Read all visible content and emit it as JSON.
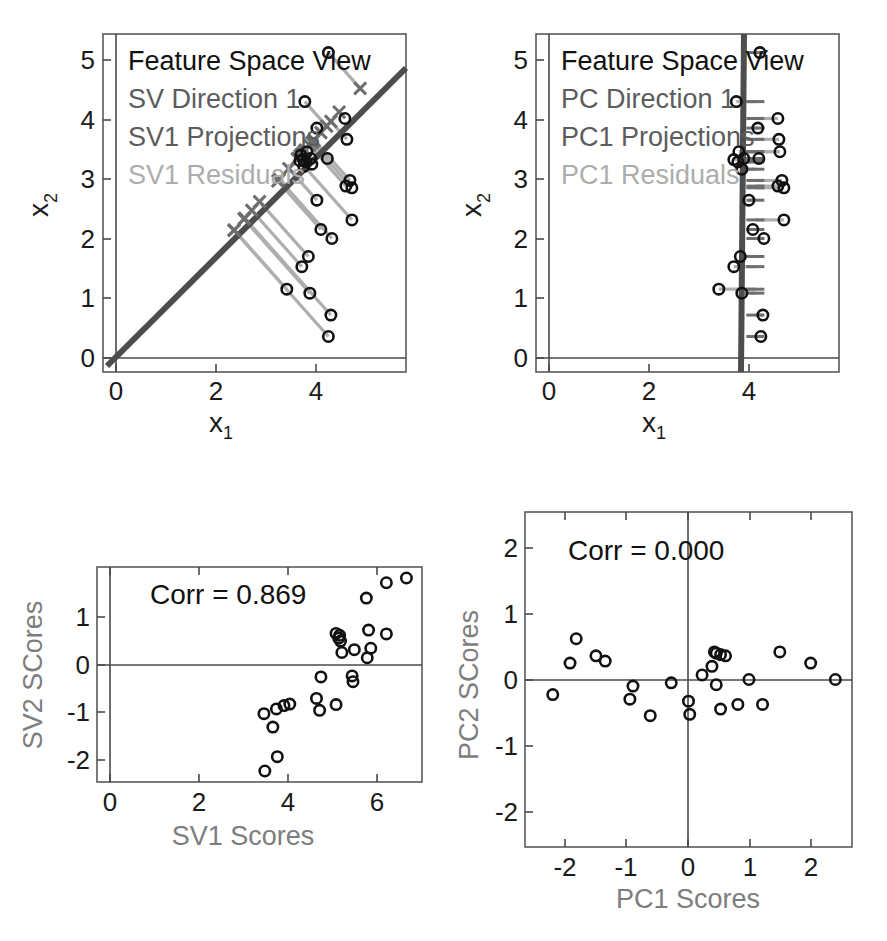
{
  "figure": {
    "background": "#ffffff",
    "colors": {
      "marker_edge": "#111111",
      "direction_line": "#4d4d4d",
      "projection": "#6e6e6e",
      "residual": "#aeaeae",
      "axis": "#4a4a4a",
      "gray_label": "#7d7d7d"
    }
  },
  "panels": {
    "top_left": {
      "name": "SV Feature Space View",
      "legend": [
        {
          "text": "Feature Space View",
          "tone": "dark"
        },
        {
          "text": "SV Direction 1",
          "tone": "mid"
        },
        {
          "text": "SV1 Projections",
          "tone": "mid"
        },
        {
          "text": "SV1 Residuals",
          "tone": "light"
        }
      ],
      "xlabel": "x",
      "xlabel_sub": "1",
      "ylabel": "x",
      "ylabel_sub": "2",
      "xticks": [
        "0",
        "2",
        "4"
      ],
      "yticks": [
        "0",
        "1",
        "2",
        "3",
        "4",
        "5"
      ]
    },
    "top_right": {
      "name": "PC Feature Space View",
      "legend": [
        {
          "text": "Feature Space View",
          "tone": "dark"
        },
        {
          "text": "PC Direction 1",
          "tone": "mid"
        },
        {
          "text": "PC1 Projections",
          "tone": "mid"
        },
        {
          "text": "PC1 Residuals",
          "tone": "light"
        }
      ],
      "xlabel": "x",
      "xlabel_sub": "1",
      "ylabel": "x",
      "ylabel_sub": "2",
      "xticks": [
        "0",
        "2",
        "4"
      ],
      "yticks": [
        "0",
        "1",
        "2",
        "3",
        "4",
        "5"
      ]
    },
    "bottom_left": {
      "name": "SV score scatter",
      "annotation": "Corr = 0.869",
      "xlabel": "SV1 Scores",
      "ylabel": "SV2 SCores",
      "xticks": [
        "0",
        "2",
        "4",
        "6"
      ],
      "yticks": [
        "-2",
        "-1",
        "0",
        "1"
      ]
    },
    "bottom_right": {
      "name": "PC score scatter",
      "annotation": "Corr = 0.000",
      "xlabel": "PC1 Scores",
      "ylabel": "PC2 SCores",
      "xticks": [
        "-2",
        "-1",
        "0",
        "1",
        "2"
      ],
      "yticks": [
        "-2",
        "-1",
        "0",
        "1",
        "2"
      ]
    }
  },
  "chart_data": [
    {
      "id": "top_left",
      "type": "scatter",
      "title": "Feature Space View",
      "xlabel": "x1",
      "ylabel": "x2",
      "xlim": [
        -0.45,
        5.6
      ],
      "ylim": [
        -0.35,
        5.65
      ],
      "grid": false,
      "legend_position": "upper-left",
      "direction_line": {
        "label": "SV Direction 1",
        "slope": 1.0,
        "intercept": 0.0
      },
      "points": [
        [
          4.05,
          5.32
        ],
        [
          3.58,
          4.45
        ],
        [
          4.38,
          4.15
        ],
        [
          3.82,
          3.98
        ],
        [
          4.42,
          3.78
        ],
        [
          3.62,
          3.56
        ],
        [
          3.55,
          3.42
        ],
        [
          3.7,
          3.44
        ],
        [
          3.72,
          3.34
        ],
        [
          4.03,
          3.44
        ],
        [
          3.6,
          3.38
        ],
        [
          4.48,
          3.05
        ],
        [
          4.52,
          2.92
        ],
        [
          4.4,
          2.95
        ],
        [
          3.82,
          2.7
        ],
        [
          4.52,
          2.35
        ],
        [
          3.9,
          2.18
        ],
        [
          4.12,
          2.02
        ],
        [
          3.65,
          1.7
        ],
        [
          3.52,
          1.52
        ],
        [
          3.22,
          1.12
        ],
        [
          3.68,
          1.05
        ],
        [
          4.1,
          0.66
        ],
        [
          4.05,
          0.28
        ],
        [
          3.5,
          3.5
        ],
        [
          3.48,
          3.4
        ],
        [
          3.56,
          3.3
        ]
      ],
      "projections": [
        [
          4.685,
          4.685
        ],
        [
          4.015,
          4.015
        ],
        [
          4.265,
          4.265
        ],
        [
          3.9,
          3.9
        ],
        [
          4.1,
          4.1
        ],
        [
          3.59,
          3.59
        ],
        [
          3.485,
          3.485
        ],
        [
          3.57,
          3.57
        ],
        [
          3.53,
          3.53
        ],
        [
          3.735,
          3.735
        ],
        [
          3.49,
          3.49
        ],
        [
          3.765,
          3.765
        ],
        [
          3.72,
          3.72
        ],
        [
          3.675,
          3.675
        ],
        [
          3.26,
          3.26
        ],
        [
          3.435,
          3.435
        ],
        [
          3.04,
          3.04
        ],
        [
          3.07,
          3.07
        ],
        [
          2.675,
          2.675
        ],
        [
          2.52,
          2.52
        ],
        [
          2.17,
          2.17
        ],
        [
          2.365,
          2.365
        ],
        [
          2.38,
          2.38
        ],
        [
          2.165,
          2.165
        ],
        [
          3.5,
          3.5
        ],
        [
          3.44,
          3.44
        ],
        [
          3.43,
          3.43
        ]
      ]
    },
    {
      "id": "top_right",
      "type": "scatter",
      "title": "Feature Space View",
      "xlabel": "x1",
      "ylabel": "x2",
      "xlim": [
        -0.45,
        5.6
      ],
      "ylim": [
        -0.35,
        5.65
      ],
      "grid": false,
      "legend_position": "upper-left",
      "direction_line": {
        "label": "PC Direction 1",
        "x_at_mean": 3.93,
        "slope_inverse": -0.01
      },
      "points": [
        [
          4.02,
          5.32
        ],
        [
          3.55,
          4.45
        ],
        [
          4.38,
          4.15
        ],
        [
          3.98,
          3.98
        ],
        [
          4.4,
          3.78
        ],
        [
          4.42,
          3.56
        ],
        [
          3.6,
          3.56
        ],
        [
          3.5,
          3.42
        ],
        [
          3.7,
          3.44
        ],
        [
          4.0,
          3.44
        ],
        [
          3.58,
          3.38
        ],
        [
          3.66,
          3.25
        ],
        [
          4.46,
          3.05
        ],
        [
          4.5,
          2.92
        ],
        [
          4.38,
          2.95
        ],
        [
          3.8,
          2.7
        ],
        [
          4.5,
          2.35
        ],
        [
          3.88,
          2.18
        ],
        [
          4.1,
          2.02
        ],
        [
          3.63,
          1.7
        ],
        [
          3.5,
          1.52
        ],
        [
          3.2,
          1.12
        ],
        [
          3.66,
          1.05
        ],
        [
          4.08,
          0.66
        ],
        [
          4.04,
          0.28
        ]
      ]
    },
    {
      "id": "bottom_left",
      "type": "scatter",
      "title": "",
      "annotation": "Corr = 0.869",
      "correlation": 0.869,
      "xlabel": "SV1 Scores",
      "ylabel": "SV2 SCores",
      "xlim": [
        -0.45,
        6.85
      ],
      "ylim": [
        -2.55,
        1.95
      ],
      "grid": false,
      "points": [
        [
          6.5,
          1.72
        ],
        [
          6.05,
          1.62
        ],
        [
          5.6,
          1.3
        ],
        [
          5.65,
          0.63
        ],
        [
          6.05,
          0.55
        ],
        [
          4.92,
          0.56
        ],
        [
          5.0,
          0.52
        ],
        [
          4.98,
          0.46
        ],
        [
          5.02,
          0.4
        ],
        [
          5.33,
          0.22
        ],
        [
          5.7,
          0.25
        ],
        [
          5.05,
          0.16
        ],
        [
          5.62,
          0.05
        ],
        [
          4.58,
          -0.35
        ],
        [
          5.28,
          -0.33
        ],
        [
          5.3,
          -0.45
        ],
        [
          4.48,
          -0.8
        ],
        [
          4.55,
          -1.05
        ],
        [
          4.92,
          -0.93
        ],
        [
          3.88,
          -0.92
        ],
        [
          3.75,
          -0.95
        ],
        [
          3.58,
          -1.02
        ],
        [
          3.3,
          -1.12
        ],
        [
          3.5,
          -1.4
        ],
        [
          3.6,
          -2.02
        ],
        [
          3.32,
          -2.32
        ]
      ]
    },
    {
      "id": "bottom_right",
      "type": "scatter",
      "title": "",
      "annotation": "Corr = 0.000",
      "correlation": 0.0,
      "xlabel": "PC1 Scores",
      "ylabel": "PC2 SCores",
      "xlim": [
        -2.55,
        2.75
      ],
      "ylim": [
        -2.55,
        2.55
      ],
      "grid": false,
      "points": [
        [
          -1.72,
          0.62
        ],
        [
          -1.82,
          0.25
        ],
        [
          -1.4,
          0.36
        ],
        [
          -1.25,
          0.28
        ],
        [
          -2.1,
          -0.23
        ],
        [
          -0.8,
          -0.1
        ],
        [
          -0.85,
          -0.3
        ],
        [
          -0.52,
          -0.55
        ],
        [
          -0.18,
          -0.05
        ],
        [
          0.1,
          -0.33
        ],
        [
          0.12,
          -0.53
        ],
        [
          0.32,
          0.07
        ],
        [
          0.48,
          0.2
        ],
        [
          0.52,
          0.42
        ],
        [
          0.55,
          0.4
        ],
        [
          0.62,
          0.38
        ],
        [
          0.7,
          0.36
        ],
        [
          0.55,
          -0.08
        ],
        [
          0.62,
          -0.45
        ],
        [
          0.9,
          -0.38
        ],
        [
          1.08,
          0.0
        ],
        [
          1.3,
          -0.38
        ],
        [
          1.58,
          0.42
        ],
        [
          2.08,
          0.25
        ],
        [
          2.48,
          0.0
        ]
      ]
    }
  ]
}
